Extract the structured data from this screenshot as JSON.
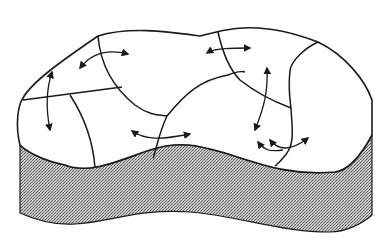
{
  "diagram": {
    "title": "",
    "colors": {
      "background": "#ffffff",
      "line": "#1a1a1a",
      "base_fill": "#a8a8a8",
      "arrow": "#1a1a1a"
    },
    "cells": 9,
    "arrows": [
      {
        "id": "a1",
        "type": "curved-double"
      },
      {
        "id": "a2",
        "type": "vertical-double"
      },
      {
        "id": "a3",
        "type": "horizontal-double"
      },
      {
        "id": "a4",
        "type": "vertical-double"
      },
      {
        "id": "a5",
        "type": "curved-double"
      },
      {
        "id": "a6",
        "type": "split-double"
      },
      {
        "id": "a7",
        "type": "split-double"
      }
    ]
  }
}
